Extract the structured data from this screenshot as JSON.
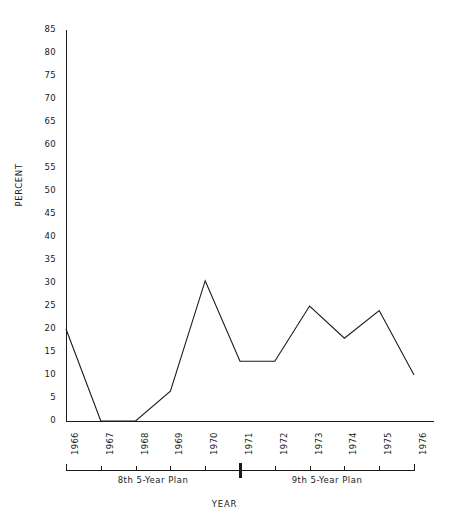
{
  "chart_data": {
    "type": "line",
    "title": "",
    "xlabel": "YEAR",
    "ylabel": "PERCENT",
    "categories": [
      "1966",
      "1967",
      "1968",
      "1969",
      "1970",
      "1971",
      "1972",
      "1973",
      "1974",
      "1975",
      "1976"
    ],
    "values": [
      20,
      0,
      0,
      6.5,
      30.5,
      13,
      13,
      25,
      18,
      24,
      10
    ],
    "series": [
      {
        "name": "Percent",
        "values": [
          20,
          0,
          0,
          6.5,
          30.5,
          13,
          13,
          25,
          18,
          24,
          10
        ]
      }
    ],
    "ylim": [
      0,
      85
    ],
    "ytick_step": 5,
    "yticks": [
      85,
      80,
      75,
      70,
      65,
      60,
      55,
      50,
      45,
      40,
      35,
      30,
      25,
      20,
      15,
      10,
      5,
      0
    ],
    "xlim": [
      "1966",
      "1976"
    ],
    "grid": false,
    "legend": false,
    "legend_position": "none",
    "line_color": "#1a1a1a",
    "annotations": [
      {
        "label": "8th 5-Year Plan",
        "start": "1966",
        "end": "1971"
      },
      {
        "label": "9th 5-Year Plan",
        "start": "1971",
        "end": "1976"
      }
    ]
  },
  "axis": {
    "y_label": "PERCENT",
    "x_label": "YEAR"
  },
  "plans": {
    "first": "8th 5-Year Plan",
    "second": "9th 5-Year Plan"
  }
}
